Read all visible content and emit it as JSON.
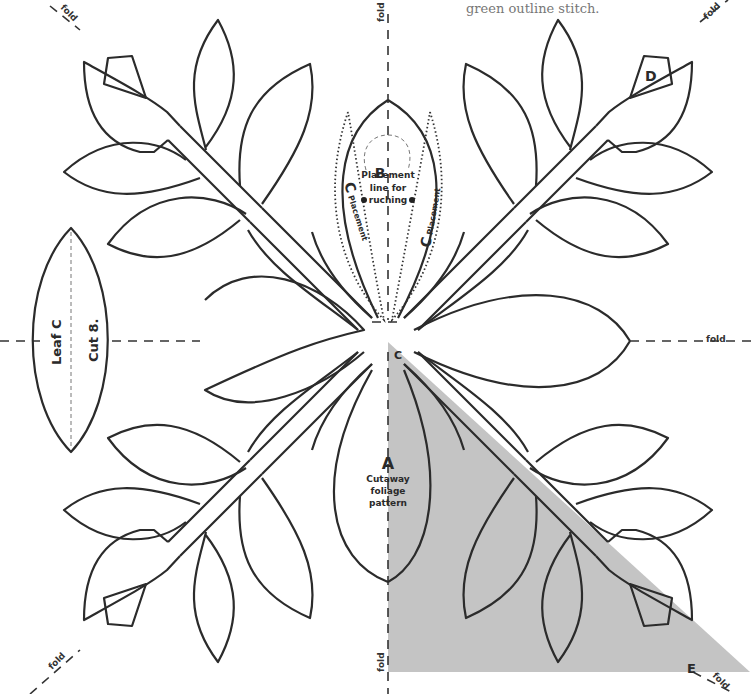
{
  "caption": "green outline stitch.",
  "fold_label": "fold",
  "labels": {
    "a_letter": "A",
    "a_text": [
      "Cutaway",
      "foliage",
      "pattern"
    ],
    "b_letter": "B",
    "placement_text": [
      "Placement",
      "line for",
      "ruching"
    ],
    "c_letter": "C",
    "c_placement": "Placement",
    "c_center": "C",
    "d_letter": "D",
    "e_letter": "E",
    "leaf_c_name": "Leaf C",
    "leaf_c_cut": "Cut 8."
  },
  "colors": {
    "outline": "#2b2b2b",
    "shade": "#c4c4c4",
    "caption": "#777777"
  }
}
